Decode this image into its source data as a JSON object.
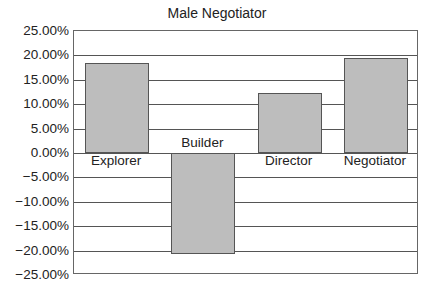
{
  "chart_data": {
    "type": "bar",
    "title": "Male Negotiator",
    "xlabel": "",
    "ylabel": "",
    "categories": [
      "Explorer",
      "Builder",
      "Director",
      "Negotiator"
    ],
    "values": [
      18.4,
      -20.7,
      12.3,
      19.5
    ],
    "value_format": "percent",
    "ylim": [
      -25,
      25
    ],
    "yticks": [
      25,
      20,
      15,
      10,
      5,
      0,
      -5,
      -10,
      -15,
      -20,
      -25
    ],
    "ytick_labels": [
      "25.00%",
      "20.00%",
      "15.00%",
      "10.00%",
      "5.00%",
      "0.00%",
      "−5.00%",
      "−10.00%",
      "−15.00%",
      "−20.00%",
      "−25.00%"
    ],
    "grid": true,
    "legend": null,
    "bar_color": "#bdbdbd"
  }
}
